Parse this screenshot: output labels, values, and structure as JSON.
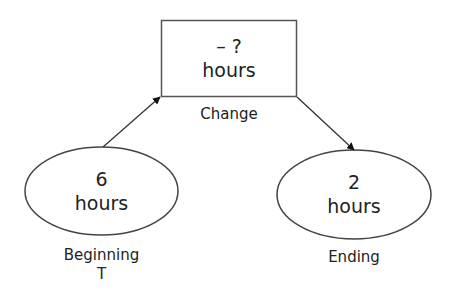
{
  "diagram": {
    "change_node": {
      "value": "– ?",
      "unit": "hours",
      "caption": "Change"
    },
    "beginning_node": {
      "value": "6",
      "unit": "hours",
      "caption": "Beginning",
      "subcaption": "T"
    },
    "ending_node": {
      "value": "2",
      "unit": "hours",
      "caption": "Ending"
    },
    "colors": {
      "stroke": "#444444",
      "text": "#222222",
      "background": "#ffffff"
    }
  }
}
